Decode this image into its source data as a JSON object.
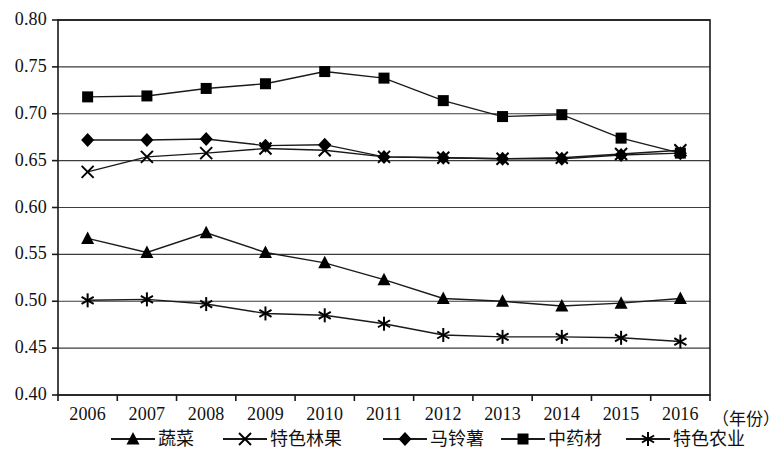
{
  "chart_data": {
    "type": "line",
    "title": "",
    "xlabel": "（年份）",
    "ylabel": "",
    "categories": [
      "2006",
      "2007",
      "2008",
      "2009",
      "2010",
      "2011",
      "2012",
      "2013",
      "2014",
      "2015",
      "2016"
    ],
    "ylim": [
      0.4,
      0.8
    ],
    "ytick_step": 0.05,
    "yticks": [
      "0.80",
      "0.75",
      "0.70",
      "0.65",
      "0.60",
      "0.55",
      "0.50",
      "0.45",
      "0.40"
    ],
    "ytick_values": [
      0.8,
      0.75,
      0.7,
      0.65,
      0.6,
      0.55,
      0.5,
      0.45,
      0.4
    ],
    "grid": true,
    "legend_position": "bottom",
    "series": [
      {
        "name": "蔬菜",
        "marker": "triangle",
        "values": [
          0.567,
          0.552,
          0.573,
          0.552,
          0.541,
          0.523,
          0.503,
          0.5,
          0.495,
          0.498,
          0.503
        ]
      },
      {
        "name": "特色林果",
        "marker": "x",
        "values": [
          0.638,
          0.654,
          0.658,
          0.663,
          0.661,
          0.654,
          0.653,
          0.652,
          0.653,
          0.657,
          0.661
        ]
      },
      {
        "name": "马铃薯",
        "marker": "diamond",
        "values": [
          0.672,
          0.672,
          0.673,
          0.666,
          0.667,
          0.654,
          0.653,
          0.652,
          0.652,
          0.656,
          0.658
        ]
      },
      {
        "name": "中药材",
        "marker": "square",
        "values": [
          0.718,
          0.719,
          0.727,
          0.732,
          0.745,
          0.738,
          0.714,
          0.697,
          0.699,
          0.674,
          0.658
        ]
      },
      {
        "name": "特色农业",
        "marker": "asterisk",
        "values": [
          0.501,
          0.502,
          0.497,
          0.487,
          0.485,
          0.476,
          0.464,
          0.462,
          0.462,
          0.461,
          0.457
        ]
      }
    ],
    "colors": {
      "line": "#1a1a1a",
      "marker": "#000000",
      "grid": "#3c3c3c",
      "axis": "#1a1a1a",
      "background": "#ffffff"
    }
  }
}
